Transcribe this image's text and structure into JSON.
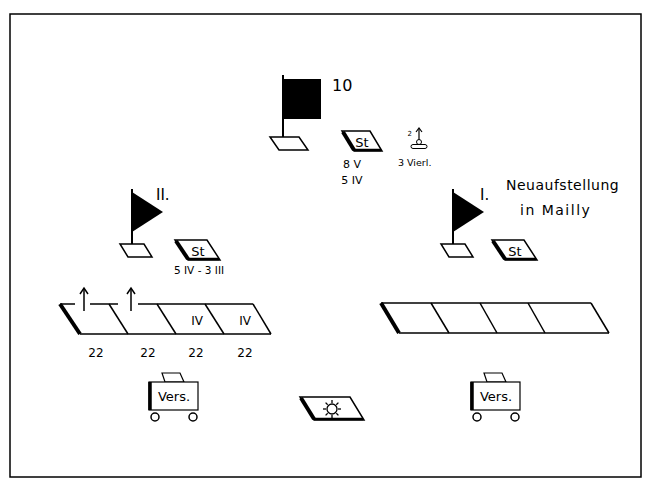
{
  "diagram": {
    "colors": {
      "ink": "#000000",
      "paper": "#ffffff"
    },
    "regiment_hq": {
      "number": "10",
      "staff_label": "St",
      "staff_strength": [
        "8 V",
        "5 IV"
      ],
      "mg_unit_label": "3 Vierl.",
      "mg_count": "2"
    },
    "battalion_ii": {
      "label": "II.",
      "staff_label": "St",
      "staff_strength": "5 IV - 3 III",
      "companies": [
        {
          "marker": "",
          "strength": "22"
        },
        {
          "marker": "",
          "strength": "22"
        },
        {
          "marker": "IV",
          "strength": "22"
        },
        {
          "marker": "IV",
          "strength": "22"
        }
      ],
      "supply_label": "Vers."
    },
    "battalion_i": {
      "label": "I.",
      "note_line1": "Neuaufstellung",
      "note_line2": "in Mailly",
      "staff_label": "St",
      "companies_count": 4,
      "supply_label": "Vers."
    },
    "center_unit": {
      "icon": "sun-icon"
    }
  }
}
